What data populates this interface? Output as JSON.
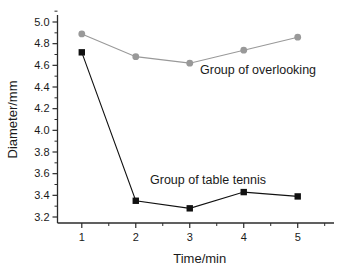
{
  "chart_data": {
    "type": "line",
    "title": "",
    "xlabel": "Time/min",
    "ylabel": "Diameter/mm",
    "x": [
      1,
      2,
      3,
      4,
      5
    ],
    "xlim": [
      0.55,
      5.45
    ],
    "ylim": [
      3.1,
      5.05
    ],
    "xticks": [
      1,
      2,
      3,
      4,
      5
    ],
    "xtick_labels": [
      "1",
      "2",
      "3",
      "4",
      "5"
    ],
    "yticks": [
      3.2,
      3.4,
      3.6,
      3.8,
      4.0,
      4.2,
      4.4,
      4.6,
      4.8,
      5.0
    ],
    "ytick_labels": [
      "3.2",
      "3.4",
      "3.6",
      "3.8",
      "4.0",
      "4.2",
      "4.4",
      "4.6",
      "4.8",
      "5.0"
    ],
    "minor_ticks": true,
    "grid": false,
    "legend": "inline-annotations",
    "series": [
      {
        "name": "Group of overlooking",
        "values": [
          4.89,
          4.68,
          4.62,
          4.74,
          4.86
        ],
        "color": "#999999",
        "marker": "circle",
        "annotation": "Group of overlooking"
      },
      {
        "name": "Group of table tennis",
        "values": [
          4.72,
          3.35,
          3.28,
          3.43,
          3.39
        ],
        "color": "#111111",
        "marker": "square",
        "annotation": "Group of table tennis"
      }
    ]
  },
  "annotations": {
    "overlooking_label": "Group of overlooking",
    "table_tennis_label": "Group of table tennis"
  },
  "axes": {
    "x_title": "Time/min",
    "y_title": "Diameter/mm",
    "x_labels": [
      "1",
      "2",
      "3",
      "4",
      "5"
    ],
    "y_labels": [
      "3.2",
      "3.4",
      "3.6",
      "3.8",
      "4.0",
      "4.2",
      "4.4",
      "4.6",
      "4.8",
      "5.0"
    ]
  },
  "colors": {
    "axis": "#2b2b2b",
    "series_overlooking": "#999999",
    "series_table_tennis": "#111111",
    "text": "#1a1a1a",
    "background": "#ffffff"
  }
}
